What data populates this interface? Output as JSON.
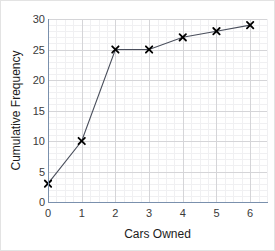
{
  "chart_data": {
    "type": "line",
    "title": "",
    "xlabel": "Cars Owned",
    "ylabel": "Cumulative Frequency",
    "x": [
      0,
      1,
      2,
      3,
      4,
      5,
      6
    ],
    "values": [
      3,
      10,
      25,
      25,
      27,
      28,
      29
    ],
    "series": [
      {
        "name": "Cumulative Frequency",
        "values": [
          3,
          10,
          25,
          25,
          27,
          28,
          29
        ]
      }
    ],
    "xlim": [
      0,
      6.5
    ],
    "ylim": [
      0,
      30
    ],
    "xticks": [
      "0",
      "1",
      "2",
      "3",
      "4",
      "5",
      "6"
    ],
    "xtick_values": [
      0,
      1,
      2,
      3,
      4,
      5,
      6
    ],
    "yticks": [
      "0",
      "5",
      "10",
      "15",
      "20",
      "25",
      "30"
    ],
    "ytick_values": [
      0,
      5,
      10,
      15,
      20,
      25,
      30
    ],
    "y_minor_step": 1,
    "x_minor_step": 0.25,
    "grid": true,
    "legend": false,
    "marker": "x-cross",
    "line_color": "#4a4f5c",
    "marker_color": "#000000",
    "grid_major_color": "#d5d5d8",
    "grid_minor_color": "#f0f0f2",
    "axis_color": "#7a90ad",
    "background_color": "#ffffff"
  }
}
